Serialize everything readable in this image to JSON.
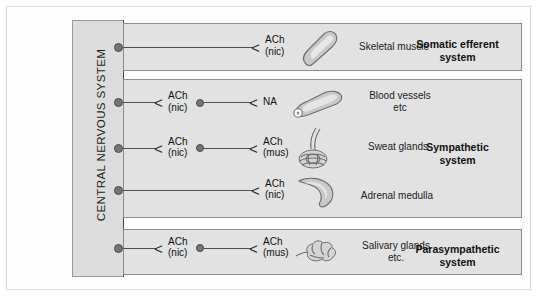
{
  "figure": {
    "cns_label": "CENTRAL NERVOUS SYSTEM"
  },
  "systems": [
    {
      "id": "somatic",
      "title": "Somatic efferent\nsystem",
      "title_line1": "Somatic efferent",
      "title_line2": "system",
      "pathways": [
        {
          "transmitters": [
            {
              "name": "ACh",
              "receptor": "(nic)"
            }
          ],
          "target_line1": "Skeletal muscle",
          "target_line2": "",
          "organ_icon": "skeletal-muscle-icon",
          "ganglion": false
        }
      ]
    },
    {
      "id": "sympathetic",
      "title": "Sympathetic system",
      "title_line1": "Sympathetic",
      "title_line2": "system",
      "pathways": [
        {
          "transmitters": [
            {
              "name": "ACh",
              "receptor": "(nic)"
            },
            {
              "name": "NA",
              "receptor": ""
            }
          ],
          "target_line1": "Blood vessels",
          "target_line2": "etc",
          "organ_icon": "blood-vessel-icon",
          "ganglion": true
        },
        {
          "transmitters": [
            {
              "name": "ACh",
              "receptor": "(nic)"
            },
            {
              "name": "ACh",
              "receptor": "(mus)"
            }
          ],
          "target_line1": "Sweat glands",
          "target_line2": "",
          "organ_icon": "sweat-gland-icon",
          "ganglion": true
        },
        {
          "transmitters": [
            {
              "name": "ACh",
              "receptor": "(nic)"
            }
          ],
          "target_line1": "Adrenal medulla",
          "target_line2": "",
          "organ_icon": "adrenal-medulla-icon",
          "ganglion": false
        }
      ]
    },
    {
      "id": "parasympathetic",
      "title": "Parasympathetic system",
      "title_line1": "Parasympathetic",
      "title_line2": "system",
      "pathways": [
        {
          "transmitters": [
            {
              "name": "ACh",
              "receptor": "(nic)"
            },
            {
              "name": "ACh",
              "receptor": "(mus)"
            }
          ],
          "target_line1": "Salivary glands",
          "target_line2": "etc.",
          "organ_icon": "salivary-gland-icon",
          "ganglion": true
        }
      ]
    }
  ],
  "colors": {
    "cns_fill": "#dcdcdc",
    "box_fill": "#e2e2e2",
    "line": "#4f4f4f",
    "dot": "#757575",
    "organ_fill": "#c9c9c9"
  }
}
